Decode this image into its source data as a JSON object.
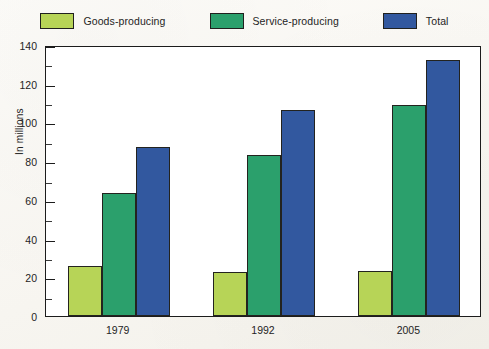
{
  "legend": {
    "items": [
      {
        "label": "Goods-producing",
        "color": "#b7d457"
      },
      {
        "label": "Service-producing",
        "color": "#2ba06c"
      },
      {
        "label": "Total",
        "color": "#32589f"
      }
    ]
  },
  "axes": {
    "y_title": "In millions",
    "y_ticks": [
      "0",
      "20",
      "40",
      "60",
      "80",
      "100",
      "120",
      "140"
    ],
    "x_ticks": [
      "1979",
      "1992",
      "2005"
    ]
  },
  "chart_data": {
    "type": "bar",
    "title": "",
    "subtitle": "",
    "xlabel": "",
    "ylabel": "In millions",
    "categories": [
      "1979",
      "1992",
      "2005"
    ],
    "series": [
      {
        "name": "Goods-producing",
        "color": "#b7d457",
        "values": [
          26,
          22.5,
          23
        ]
      },
      {
        "name": "Service-producing",
        "color": "#2ba06c",
        "values": [
          63.5,
          83,
          109
        ]
      },
      {
        "name": "Total",
        "color": "#32589f",
        "values": [
          87.5,
          106.5,
          132.5
        ]
      }
    ],
    "ylim": [
      0,
      140
    ],
    "y_major_step": 20,
    "y_minor_step": 10,
    "grid": false,
    "legend_position": "top"
  }
}
